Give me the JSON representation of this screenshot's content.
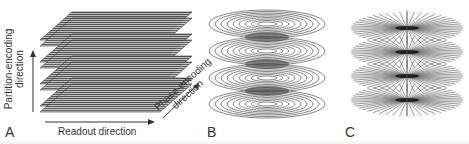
{
  "figure": {
    "panels": [
      {
        "id": "A",
        "letter": "A",
        "description": "Stack of parallel Cartesian planes (3D Cartesian k-space sampling)",
        "slab_count": 4,
        "labels": {
          "vertical_line1": "Partition-encoding",
          "vertical_line2": "direction",
          "horizontal": "Readout direction",
          "diagonal_line1": "Phase-encoding",
          "diagonal_line2": "direction"
        }
      },
      {
        "id": "B",
        "letter": "B",
        "description": "Stack of spirals",
        "stack_count": 4
      },
      {
        "id": "C",
        "letter": "C",
        "description": "Stack of radial projections (stack of stars)",
        "stack_count": 4
      }
    ],
    "colors": {
      "line": "#555555",
      "dark": "#222222",
      "text": "#333333",
      "background": "#ffffff"
    }
  }
}
